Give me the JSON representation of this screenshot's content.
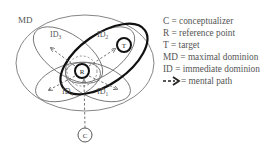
{
  "diagram": {
    "labels": {
      "md": "MD",
      "id_top_left": "ID",
      "id_top_left_sub": "3",
      "id_top_right": "ID",
      "id_top_right_sub": "2",
      "id_bottom_left": "ID",
      "id_bottom_left_sub": "4",
      "id_bottom_right": "ID",
      "id_bottom_right_sub": "1",
      "reference_point": "R",
      "target": "T",
      "conceptualizer": "C"
    },
    "colors": {
      "line": "#666666",
      "bold": "#111111",
      "text": "#555555"
    }
  },
  "legend": {
    "items": [
      {
        "key": "C",
        "text": "= conceptualizer"
      },
      {
        "key": "R",
        "text": "= reference point"
      },
      {
        "key": "T",
        "text": "= target"
      },
      {
        "key": "MD",
        "text": "= maximal dominion"
      },
      {
        "key": "ID",
        "text": "= immediate dominion"
      },
      {
        "key": "",
        "text": "= mental path"
      }
    ]
  }
}
